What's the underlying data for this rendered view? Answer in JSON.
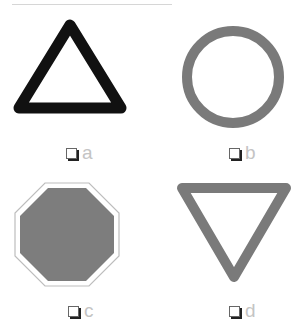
{
  "header": {
    "cut_off_text": ""
  },
  "options": [
    {
      "id": "a",
      "label": "a",
      "shape": "triangle-up",
      "style": "black thick outline",
      "checked": false
    },
    {
      "id": "b",
      "label": "b",
      "shape": "circle",
      "style": "gray thick outline",
      "checked": false
    },
    {
      "id": "c",
      "label": "c",
      "shape": "octagon",
      "style": "gray filled with white inner border",
      "checked": false
    },
    {
      "id": "d",
      "label": "d",
      "shape": "triangle-down",
      "style": "gray thick outline",
      "checked": false
    }
  ],
  "colors": {
    "black_stroke": "#111111",
    "gray_stroke": "#7a7a7a",
    "gray_fill": "#7d7d7d",
    "label_text": "#c4c4c4",
    "checkbox_border": "#666666"
  }
}
